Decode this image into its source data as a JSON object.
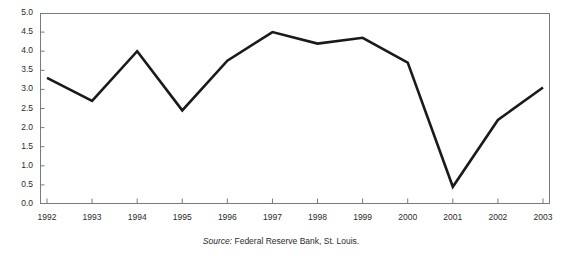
{
  "chart_data": {
    "type": "line",
    "title": "",
    "xlabel": "",
    "ylabel": "",
    "categories": [
      "1992",
      "1993",
      "1994",
      "1995",
      "1996",
      "1997",
      "1998",
      "1999",
      "2000",
      "2001",
      "2002",
      "2003"
    ],
    "values": [
      3.3,
      2.7,
      4.0,
      2.45,
      3.75,
      4.5,
      4.2,
      4.35,
      3.7,
      0.45,
      2.2,
      3.05
    ],
    "series": [
      {
        "name": "series-1",
        "values": [
          3.3,
          2.7,
          4.0,
          2.45,
          3.75,
          4.5,
          4.2,
          4.35,
          3.7,
          0.45,
          2.2,
          3.05
        ]
      }
    ],
    "ylim": [
      0.0,
      5.0
    ],
    "ytick_labels": [
      "5.0",
      "4.5",
      "4.0",
      "3.5",
      "3.0",
      "2.5",
      "2.0",
      "1.5",
      "1.0",
      "0.5",
      "0.0"
    ],
    "ytick_values": [
      5.0,
      4.5,
      4.0,
      3.5,
      3.0,
      2.5,
      2.0,
      1.5,
      1.0,
      0.5,
      0.0
    ],
    "grid": false,
    "legend": "none",
    "line_color": "#1a1a1a",
    "line_width": 2.6,
    "axis_color": "#7a7a7a",
    "plot_border": true
  },
  "source": {
    "label": "Source:",
    "text": "Federal Reserve Bank, St. Louis."
  }
}
